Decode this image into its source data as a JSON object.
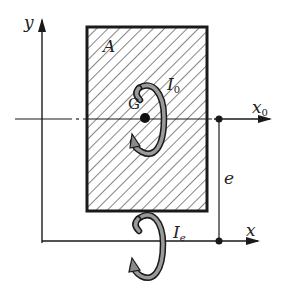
{
  "diagram": {
    "type": "parallel-axis-theorem",
    "labels": {
      "y_axis": "y",
      "area": "A",
      "centroid": "G",
      "moment_centroid": "I",
      "moment_centroid_sub": "0",
      "x0_axis": "x",
      "x0_axis_sub": "0",
      "distance": "e",
      "moment_parallel": "I",
      "moment_parallel_sub": "e",
      "x_axis": "x"
    },
    "colors": {
      "line": "#1a1a1a",
      "hatch": "#333333",
      "arrow_fill": "#8a8a8a",
      "background": "#ffffff"
    }
  }
}
